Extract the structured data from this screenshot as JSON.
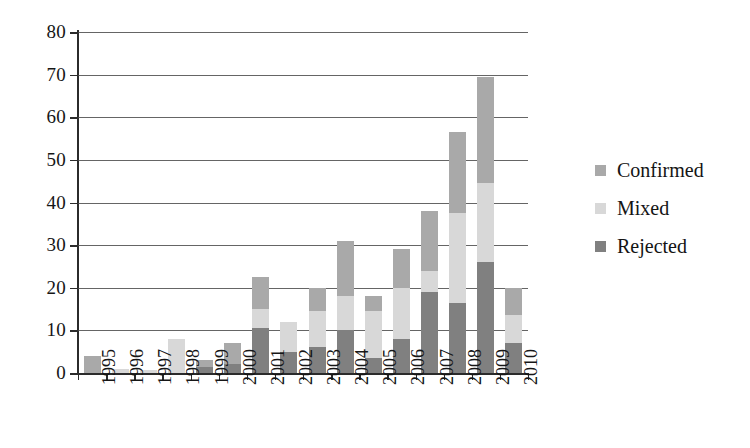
{
  "chart_data": {
    "type": "bar",
    "stacked": true,
    "title": "",
    "xlabel": "",
    "ylabel": "",
    "ylim": [
      0,
      80
    ],
    "ytick_step": 10,
    "yticks": [
      "0",
      "10",
      "20",
      "30",
      "40",
      "50",
      "60",
      "70",
      "80"
    ],
    "grid": true,
    "legend_position": "right",
    "categories": [
      "1995",
      "1996",
      "1997",
      "1998",
      "1999",
      "2000",
      "2001",
      "2002",
      "2003",
      "2004",
      "2005",
      "2006",
      "2007",
      "2008",
      "2009",
      "2010"
    ],
    "series": [
      {
        "name": "Rejected",
        "color": "#808080",
        "values": [
          0,
          0,
          0,
          0,
          1.5,
          2,
          10.5,
          5,
          6,
          10,
          3.5,
          8,
          19,
          16.5,
          26,
          7
        ]
      },
      {
        "name": "Mixed",
        "color": "#d8d8d8",
        "values": [
          0,
          1,
          0.8,
          8,
          0,
          0,
          4.5,
          7,
          8.5,
          8,
          11,
          12,
          5,
          21,
          18.5,
          6.5
        ]
      },
      {
        "name": "Confirmed",
        "color": "#a9a9a9",
        "values": [
          4,
          0,
          0,
          0,
          1.5,
          5,
          7.5,
          0,
          5.5,
          13,
          3.5,
          9,
          14,
          19,
          25,
          6.5
        ]
      }
    ],
    "totals": [
      4,
      1,
      0.8,
      8,
      3,
      7,
      22.5,
      12,
      20,
      31,
      18,
      29,
      38,
      56.5,
      69.5,
      20
    ],
    "legend": [
      {
        "label": "Confirmed",
        "color": "#a9a9a9"
      },
      {
        "label": "Mixed",
        "color": "#d8d8d8"
      },
      {
        "label": "Rejected",
        "color": "#808080"
      }
    ]
  }
}
